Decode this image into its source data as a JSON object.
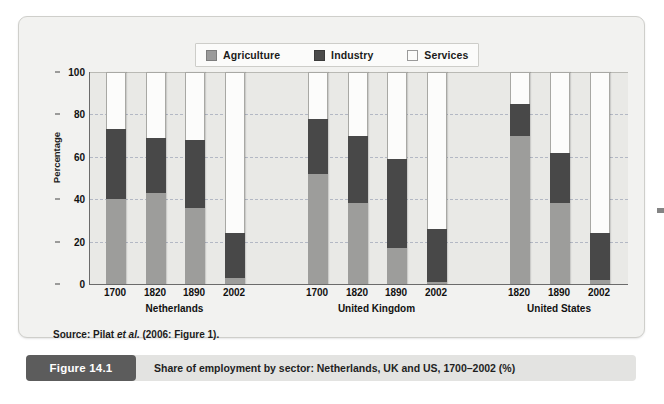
{
  "figure": {
    "badge": "Figure 14.1",
    "caption": "Share of employment by sector: Netherlands, UK and US, 1700–2002 (%)",
    "source": "Source: Pilat ",
    "source_italic": "et al.",
    "source_tail": " (2006: Figure 1)."
  },
  "legend": {
    "items": [
      {
        "label": "Agriculture",
        "swatch": "agriculture-swatch",
        "color": "#9d9d9b"
      },
      {
        "label": "Industry",
        "swatch": "industry-swatch",
        "color": "#484848"
      },
      {
        "label": "Services",
        "swatch": "services-swatch",
        "color": "#fcfcfb"
      }
    ]
  },
  "chart_data": {
    "type": "bar",
    "subtype": "stacked-vertical-100",
    "title": "Share of employment by sector: Netherlands, UK and US, 1700–2002 (%)",
    "xlabel": "",
    "ylabel": "Percentage",
    "ylim": [
      0,
      100
    ],
    "yticks": [
      0,
      20,
      40,
      60,
      80,
      100
    ],
    "grid": "horizontal-dashed",
    "legend_position": "top-center",
    "groups": [
      "Netherlands",
      "United Kingdom",
      "United States"
    ],
    "categories": [
      "1700",
      "1820",
      "1890",
      "2002",
      "1700",
      "1820",
      "1890",
      "2002",
      "1820",
      "1890",
      "2002"
    ],
    "group_of_category": [
      "Netherlands",
      "Netherlands",
      "Netherlands",
      "Netherlands",
      "United Kingdom",
      "United Kingdom",
      "United Kingdom",
      "United Kingdom",
      "United States",
      "United States",
      "United States"
    ],
    "series": [
      {
        "name": "Agriculture",
        "color": "#9d9d9b",
        "values": [
          40,
          43,
          36,
          3,
          52,
          38,
          17,
          1,
          70,
          38,
          2
        ]
      },
      {
        "name": "Industry",
        "color": "#484848",
        "values": [
          33,
          26,
          32,
          21,
          26,
          32,
          42,
          25,
          15,
          24,
          22
        ]
      },
      {
        "name": "Services",
        "color": "#fcfcfb",
        "values": [
          27,
          31,
          32,
          76,
          22,
          30,
          41,
          74,
          15,
          38,
          76
        ]
      }
    ],
    "cumulative_tops": {
      "agriculture_plus_industry": [
        73,
        69,
        68,
        24,
        78,
        70,
        59,
        26,
        85,
        62,
        24
      ]
    }
  },
  "axis": {
    "ytick_labels": [
      "0",
      "20",
      "40",
      "60",
      "80",
      "100"
    ]
  }
}
